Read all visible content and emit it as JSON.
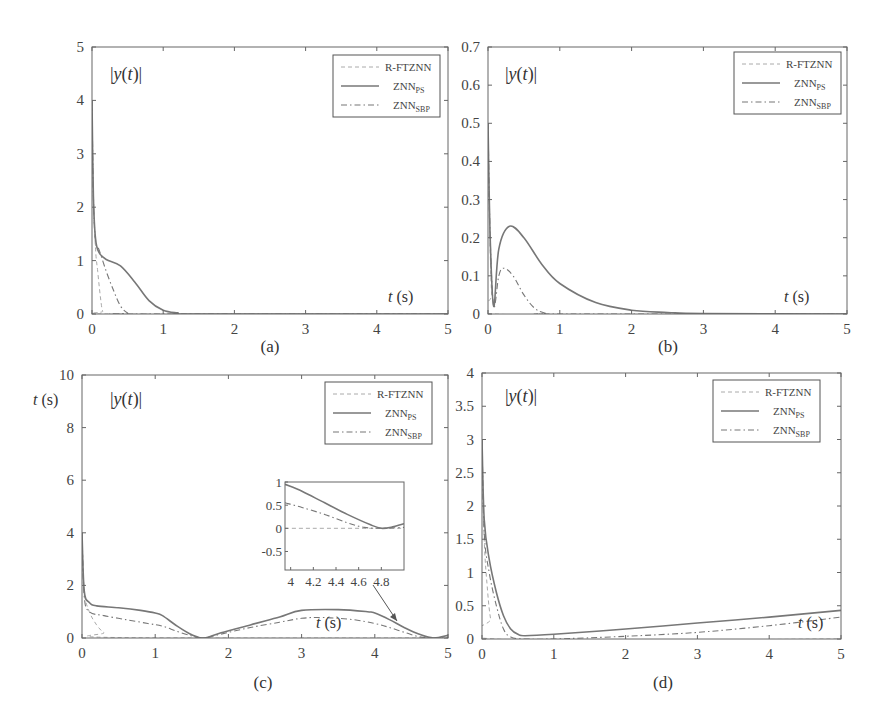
{
  "figure": {
    "panels": [
      "(a)",
      "(b)",
      "(c)",
      "(d)"
    ]
  },
  "legend": {
    "entries": [
      {
        "name": "R-FTZNN",
        "base": "R-FTZNN",
        "sub": "",
        "style": "dashed"
      },
      {
        "name": "ZNN_PS",
        "base": "ZNN",
        "sub": "PS",
        "style": "solid"
      },
      {
        "name": "ZNN_SBP",
        "base": "ZNN",
        "sub": "SBP",
        "style": "dash-dot"
      }
    ]
  },
  "labels": {
    "ylabel_prefix": "|",
    "ylabel_y": "y",
    "ylabel_open": "(",
    "ylabel_t": "t",
    "ylabel_close": ")|",
    "xlabel_t": "t",
    "xlabel_unit": " (s)",
    "c_side_t": "t",
    "c_side_unit": " (s)"
  },
  "chart_data": [
    {
      "type": "line",
      "panel": "(a)",
      "title": "",
      "ylabel": "|y(t)|",
      "xlabel": "t (s)",
      "xlim": [
        0,
        5
      ],
      "ylim": [
        0,
        5
      ],
      "xticks": [
        "0",
        "1",
        "2",
        "3",
        "4",
        "5"
      ],
      "yticks": [
        "0",
        "1",
        "2",
        "3",
        "4",
        "5"
      ],
      "legend_position": "upper right",
      "grid": false,
      "series": [
        {
          "name": "R-FTZNN",
          "x": [
            0,
            0.02,
            0.05,
            0.08,
            0.12,
            0.15,
            0.2,
            5
          ],
          "y": [
            4.0,
            2.2,
            1.2,
            0.8,
            0.3,
            0.05,
            0,
            0
          ]
        },
        {
          "name": "ZNN_PS",
          "x": [
            0,
            0.02,
            0.05,
            0.1,
            0.2,
            0.4,
            0.6,
            0.8,
            1.0,
            1.2,
            1.5,
            5
          ],
          "y": [
            4.0,
            2.2,
            1.4,
            1.15,
            1.02,
            0.9,
            0.6,
            0.25,
            0.07,
            0.02,
            0,
            0
          ]
        },
        {
          "name": "ZNN_SBP",
          "x": [
            0,
            0.02,
            0.05,
            0.1,
            0.2,
            0.3,
            0.4,
            0.5,
            0.6,
            5
          ],
          "y": [
            4.0,
            2.2,
            1.35,
            1.2,
            0.8,
            0.45,
            0.15,
            0.02,
            0,
            0
          ]
        }
      ]
    },
    {
      "type": "line",
      "panel": "(b)",
      "title": "",
      "ylabel": "|y(t)|",
      "xlabel": "t (s)",
      "xlim": [
        0,
        5
      ],
      "ylim": [
        0,
        0.7
      ],
      "xticks": [
        "0",
        "1",
        "2",
        "3",
        "4",
        "5"
      ],
      "yticks": [
        "0",
        "0.1",
        "0.2",
        "0.3",
        "0.4",
        "0.5",
        "0.6",
        "0.7"
      ],
      "legend_position": "upper right",
      "grid": false,
      "series": [
        {
          "name": "R-FTZNN",
          "x": [
            0,
            0.02,
            0.05,
            0.08,
            5
          ],
          "y": [
            0.5,
            0.25,
            0.05,
            0,
            0
          ]
        },
        {
          "name": "ZNN_PS",
          "x": [
            0,
            0.03,
            0.08,
            0.15,
            0.3,
            0.5,
            0.75,
            1.0,
            1.5,
            2.0,
            2.5,
            3,
            5
          ],
          "y": [
            0.5,
            0.2,
            0.02,
            0.17,
            0.23,
            0.2,
            0.13,
            0.08,
            0.03,
            0.01,
            0.004,
            0.001,
            0
          ]
        },
        {
          "name": "ZNN_SBP",
          "x": [
            0,
            0.03,
            0.08,
            0.15,
            0.22,
            0.35,
            0.5,
            0.65,
            0.8,
            1.0,
            5
          ],
          "y": [
            0.5,
            0.2,
            0.02,
            0.1,
            0.12,
            0.1,
            0.05,
            0.015,
            0.002,
            0,
            0
          ]
        }
      ]
    },
    {
      "type": "line",
      "panel": "(c)",
      "title": "",
      "ylabel": "|y(t)|",
      "xlabel": "t (s)",
      "side_label": "t (s)",
      "xlim": [
        0,
        5
      ],
      "ylim": [
        0,
        10
      ],
      "xticks": [
        "0",
        "1",
        "2",
        "3",
        "4",
        "5"
      ],
      "yticks": [
        "0",
        "2",
        "4",
        "6",
        "8",
        "10"
      ],
      "legend_position": "upper right",
      "grid": false,
      "series": [
        {
          "name": "R-FTZNN",
          "x": [
            0,
            0.03,
            0.1,
            0.2,
            0.3,
            0.45,
            5
          ],
          "y": [
            4.0,
            1.8,
            1.0,
            0.5,
            0.2,
            0.02,
            0
          ]
        },
        {
          "name": "ZNN_PS",
          "x": [
            0,
            0.03,
            0.1,
            0.2,
            0.5,
            0.8,
            1.0,
            1.1,
            1.3,
            1.5,
            1.67,
            1.9,
            2.3,
            2.7,
            3.0,
            3.5,
            3.9,
            4.0,
            4.2,
            4.4,
            4.6,
            4.8,
            5.0
          ],
          "y": [
            4.0,
            1.8,
            1.35,
            1.22,
            1.15,
            1.05,
            0.95,
            0.85,
            0.45,
            0.12,
            0,
            0.2,
            0.5,
            0.8,
            1.05,
            1.08,
            1.0,
            0.95,
            0.7,
            0.4,
            0.15,
            0.0,
            0.1
          ]
        },
        {
          "name": "ZNN_SBP",
          "x": [
            0,
            0.03,
            0.1,
            0.3,
            0.6,
            0.9,
            1.1,
            1.3,
            1.5,
            1.67,
            1.9,
            2.3,
            2.7,
            3.0,
            3.3,
            3.7,
            4.0,
            4.2,
            4.4,
            4.6,
            4.8,
            5.0
          ],
          "y": [
            4.0,
            1.6,
            1.0,
            0.85,
            0.7,
            0.55,
            0.45,
            0.25,
            0.08,
            0,
            0.15,
            0.4,
            0.6,
            0.75,
            0.78,
            0.7,
            0.55,
            0.4,
            0.22,
            0.05,
            0.0,
            0.02
          ]
        }
      ],
      "inset": {
        "xlim": [
          3.95,
          5.0
        ],
        "ylim": [
          -0.9,
          1.0
        ],
        "xticks": [
          "4",
          "4.2",
          "4.4",
          "4.6",
          "4.8"
        ],
        "yticks": [
          "1",
          "0.5",
          "0",
          "-0.5"
        ],
        "series": [
          {
            "name": "R-FTZNN",
            "x": [
              3.95,
              5.0
            ],
            "y": [
              0,
              0
            ]
          },
          {
            "name": "ZNN_PS",
            "x": [
              3.95,
              4.1,
              4.3,
              4.5,
              4.7,
              4.8,
              4.9,
              5.0
            ],
            "y": [
              0.95,
              0.8,
              0.55,
              0.3,
              0.08,
              0.0,
              0.03,
              0.1
            ]
          },
          {
            "name": "ZNN_SBP",
            "x": [
              3.95,
              4.1,
              4.3,
              4.5,
              4.65,
              4.8,
              5.0
            ],
            "y": [
              0.55,
              0.45,
              0.3,
              0.12,
              0.02,
              0.0,
              0.02
            ]
          }
        ],
        "annotation": "arrow from inset to t≈4.4 on main curve"
      }
    },
    {
      "type": "line",
      "panel": "(d)",
      "title": "",
      "ylabel": "|y(t)|",
      "xlabel": "t (s)",
      "xlim": [
        0,
        5
      ],
      "ylim": [
        0,
        4
      ],
      "xticks": [
        "0",
        "1",
        "2",
        "3",
        "4",
        "5"
      ],
      "yticks": [
        "0",
        "0.5",
        "1",
        "1.5",
        "2",
        "2.5",
        "3",
        "3.5",
        "4"
      ],
      "legend_position": "upper right",
      "grid": false,
      "series": [
        {
          "name": "R-FTZNN",
          "x": [
            0,
            0.03,
            0.08,
            0.12,
            0.18,
            5
          ],
          "y": [
            3.0,
            1.5,
            0.7,
            0.3,
            0.0,
            0.0
          ]
        },
        {
          "name": "ZNN_PS",
          "x": [
            0,
            0.03,
            0.1,
            0.2,
            0.3,
            0.4,
            0.5,
            0.6,
            1.0,
            2.0,
            3.0,
            4.0,
            5.0
          ],
          "y": [
            3.0,
            1.8,
            1.2,
            0.7,
            0.35,
            0.15,
            0.07,
            0.05,
            0.07,
            0.15,
            0.24,
            0.33,
            0.43
          ]
        },
        {
          "name": "ZNN_SBP",
          "x": [
            0,
            0.03,
            0.1,
            0.2,
            0.3,
            0.4,
            0.6,
            1.0,
            2.0,
            3.0,
            4.0,
            5.0
          ],
          "y": [
            3.0,
            1.6,
            1.0,
            0.5,
            0.15,
            0.03,
            0.0,
            0.0,
            0.04,
            0.1,
            0.2,
            0.33
          ]
        }
      ]
    }
  ]
}
